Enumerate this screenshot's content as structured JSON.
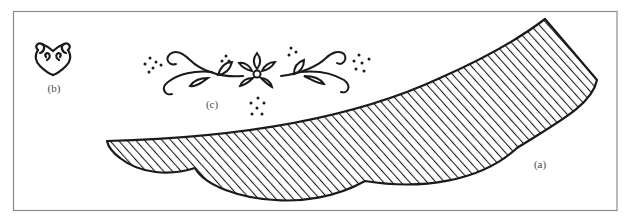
{
  "figure": {
    "frame_color": "#8a8a8a",
    "ink_color": "#1a1a1a",
    "label_color": "#4a4a4a",
    "panels": [
      {
        "id": "a",
        "label": "(a)",
        "description": "scalloped crescent band with diagonal hatching"
      },
      {
        "id": "b",
        "label": "(b)",
        "description": "small heart-shaped scroll motif"
      },
      {
        "id": "c",
        "label": "(c)",
        "description": "symmetric floral scroll with dot clusters"
      }
    ]
  }
}
